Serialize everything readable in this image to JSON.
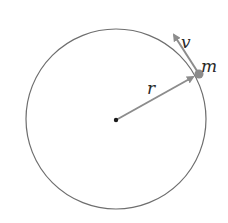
{
  "diagram": {
    "type": "uniform-circular-motion",
    "colors": {
      "circle": "#6e6e6e",
      "vector": "#8c8c8c",
      "mass": "#8c8c8c",
      "center": "#1a1a1a",
      "text": "#2a2a2a"
    },
    "circle": {
      "cx": 116,
      "cy": 119,
      "r": 90
    },
    "center_point": {
      "x": 116,
      "y": 120
    },
    "mass": {
      "x": 199,
      "y": 74,
      "label": "m"
    },
    "radius_vector": {
      "from": [
        116,
        120
      ],
      "to": [
        195,
        76
      ],
      "label": "r"
    },
    "velocity_vector": {
      "from": [
        199,
        74
      ],
      "to": [
        172,
        32
      ],
      "label": "v"
    }
  }
}
